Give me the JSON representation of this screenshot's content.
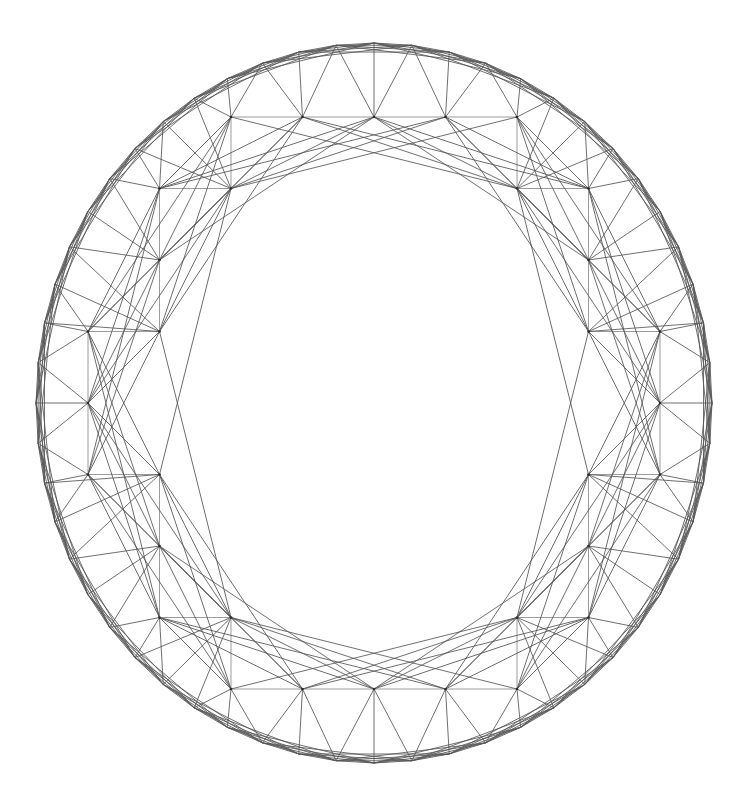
{
  "figure": {
    "type": "geometric-diagram",
    "width": 752,
    "height": 808,
    "background_color": "#ffffff"
  },
  "chart_data": {
    "type": "scatter",
    "subtitle": "",
    "xlabel": "",
    "ylabel": "",
    "grid": false,
    "legend": null,
    "annotations": [],
    "geometry": {
      "center_x": 374,
      "center_y": 403,
      "radius_x": 338,
      "radius_y": 360,
      "grid_spacing": 71.5,
      "grid_origin_x": 374,
      "grid_origin_y": 403,
      "inner_void_radius": 1.05,
      "boundary_band": 0.965
    },
    "edge_offsets": [
      [
        1,
        0
      ],
      [
        0,
        1
      ],
      [
        1,
        1
      ],
      [
        1,
        -1
      ],
      [
        2,
        1
      ],
      [
        1,
        2
      ],
      [
        2,
        -1
      ],
      [
        1,
        -2
      ],
      [
        2,
        2
      ],
      [
        2,
        -2
      ],
      [
        3,
        1
      ],
      [
        1,
        3
      ],
      [
        3,
        -1
      ],
      [
        1,
        -3
      ],
      [
        3,
        2
      ],
      [
        2,
        3
      ],
      [
        3,
        -2
      ],
      [
        2,
        -3
      ],
      [
        4,
        1
      ],
      [
        1,
        4
      ],
      [
        4,
        -1
      ],
      [
        1,
        -4
      ]
    ],
    "axis_offsets": [
      [
        1,
        0
      ],
      [
        0,
        1
      ]
    ],
    "styles": {
      "edge_color": "#555555",
      "axis_color": "#8a8a8a",
      "vertex_color": "#2b2b2b",
      "edge_width": 0.85,
      "vertex_radius": 1.35
    },
    "counts": {
      "lattice_rows": 11,
      "lattice_cols": 11
    }
  }
}
